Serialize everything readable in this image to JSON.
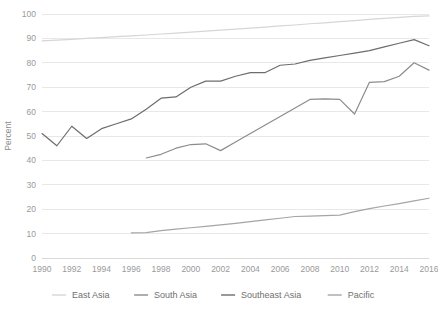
{
  "chart_data": {
    "type": "line",
    "title": "",
    "xlabel": "",
    "ylabel": "Percent",
    "ylim": [
      0,
      100
    ],
    "xlim": [
      1990,
      2016
    ],
    "grid": true,
    "legend_position": "bottom",
    "y_ticks": [
      0,
      10,
      20,
      30,
      40,
      50,
      60,
      70,
      80,
      90,
      100
    ],
    "x_ticks": [
      1990,
      1992,
      1994,
      1996,
      1998,
      2000,
      2002,
      2004,
      2006,
      2008,
      2010,
      2012,
      2014,
      2016
    ],
    "x": [
      1990,
      1991,
      1992,
      1993,
      1994,
      1995,
      1996,
      1997,
      1998,
      1999,
      2000,
      2001,
      2002,
      2003,
      2004,
      2005,
      2006,
      2007,
      2008,
      2009,
      2010,
      2011,
      2012,
      2013,
      2014,
      2015,
      2016
    ],
    "series": [
      {
        "name": "East Asia",
        "color": "#d6d6d6",
        "x": [
          1990,
          1991,
          1992,
          1993,
          1994,
          1995,
          1996,
          1997,
          1998,
          1999,
          2000,
          2001,
          2002,
          2003,
          2004,
          2005,
          2006,
          2007,
          2008,
          2009,
          2010,
          2011,
          2012,
          2013,
          2014,
          2015,
          2016
        ],
        "values": [
          89.0,
          89.3,
          89.6,
          90.0,
          90.3,
          90.7,
          91.0,
          91.4,
          91.8,
          92.2,
          92.6,
          93.0,
          93.4,
          93.8,
          94.2,
          94.6,
          95.1,
          95.5,
          96.0,
          96.4,
          96.9,
          97.3,
          97.8,
          98.2,
          98.6,
          99.0,
          99.2
        ]
      },
      {
        "name": "South Asia",
        "color": "#8c8c8c",
        "x": [
          1997,
          1998,
          1999,
          2000,
          2001,
          2002,
          2003,
          2004,
          2005,
          2006,
          2007,
          2008,
          2009,
          2010,
          2011,
          2012,
          2013,
          2014,
          2015,
          2016
        ],
        "values": [
          41.0,
          42.5,
          45.0,
          46.5,
          46.8,
          44.0,
          47.5,
          51.0,
          54.5,
          58.0,
          61.5,
          65.0,
          65.2,
          65.0,
          59.0,
          72.0,
          72.3,
          74.5,
          80.0,
          77.0
        ]
      },
      {
        "name": "Southeast Asia",
        "color": "#6d6d6d",
        "x": [
          1990,
          1991,
          1992,
          1993,
          1994,
          1995,
          1996,
          1997,
          1998,
          1999,
          2000,
          2001,
          2002,
          2003,
          2004,
          2005,
          2006,
          2007,
          2008,
          2009,
          2010,
          2011,
          2012,
          2013,
          2014,
          2015,
          2016
        ],
        "values": [
          51.0,
          46.0,
          54.0,
          49.0,
          53.0,
          55.0,
          57.0,
          61.0,
          65.5,
          66.0,
          70.0,
          72.5,
          72.5,
          74.5,
          76.0,
          76.0,
          79.0,
          79.5,
          81.0,
          82.0,
          83.0,
          84.0,
          85.0,
          86.5,
          88.0,
          89.5,
          87.0
        ]
      },
      {
        "name": "Pacific",
        "color": "#a5a5a5",
        "x": [
          1996,
          1997,
          1998,
          1999,
          2000,
          2001,
          2002,
          2003,
          2004,
          2005,
          2006,
          2007,
          2008,
          2009,
          2010,
          2011,
          2012,
          2013,
          2014,
          2015,
          2016
        ],
        "values": [
          10.3,
          10.4,
          11.2,
          11.8,
          12.4,
          13.0,
          13.6,
          14.2,
          14.9,
          15.6,
          16.3,
          17.0,
          17.2,
          17.4,
          17.6,
          19.0,
          20.2,
          21.3,
          22.3,
          23.4,
          24.5
        ]
      }
    ]
  }
}
